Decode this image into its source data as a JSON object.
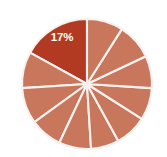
{
  "chart_data": {
    "type": "pie",
    "title": "",
    "subtitle": "",
    "xlabel": "",
    "ylabel": "",
    "legend": "none",
    "grid": false,
    "background_color": "#ffffff",
    "slice_border_color": "#f7f2ef",
    "highlight_color": "#b23a22",
    "base_color": "#c9775c",
    "label_text_color": "#ffffff",
    "center": {
      "x": 87,
      "y": 84
    },
    "radius": 65,
    "start_angle_deg": 270,
    "direction": "counterclockwise",
    "categories": [
      "Slice 1",
      "Slice 2",
      "Slice 3",
      "Slice 4",
      "Slice 5",
      "Slice 6",
      "Slice 7",
      "Slice 8",
      "Slice 9",
      "Slice 10",
      "Slice 11"
    ],
    "values": [
      17,
      9,
      9,
      8,
      8,
      7,
      8,
      8,
      8,
      9,
      9
    ],
    "labels": [
      "17%",
      "",
      "",
      "",
      "",
      "",
      "",
      "",
      "",
      "",
      ""
    ],
    "colors": [
      "#b23a22",
      "#c9775c",
      "#c9775c",
      "#c9775c",
      "#c9775c",
      "#c9775c",
      "#c9775c",
      "#c9775c",
      "#c9775c",
      "#c9775c",
      "#c9775c"
    ],
    "highlighted_index": 0,
    "highlighted_label": "17%",
    "highlighted_label_position": {
      "x": 62,
      "y": 38
    }
  },
  "chart": {
    "highlight_label": "17%"
  }
}
